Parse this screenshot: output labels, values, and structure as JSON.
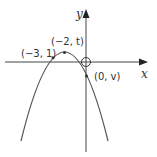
{
  "diagram": {
    "type": "parabola-graph",
    "axes": {
      "x_label": "x",
      "y_label": "y"
    },
    "points": [
      {
        "label": "(−3, 1)",
        "role": "point-on-curve"
      },
      {
        "label": "(−2, t)",
        "role": "vertex"
      },
      {
        "label": "(0, v)",
        "role": "y-intercept"
      }
    ],
    "origin_marker": "circle",
    "colors": {
      "curve": "#555555",
      "axis": "#444444",
      "text": "#333333"
    }
  }
}
